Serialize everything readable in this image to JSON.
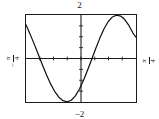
{
  "figure": {
    "kind": "function-graph",
    "frame_color": "#1b1b1b",
    "curve_color": "#111111",
    "background": "#ffffff"
  },
  "labels": {
    "top": "2",
    "bottom": "−2",
    "left": {
      "minus": "−",
      "numerator": "π",
      "denominator": "4"
    },
    "right": {
      "minus": "",
      "numerator": "π",
      "denominator": "4"
    }
  },
  "chart_data": {
    "type": "line",
    "title": "",
    "xlabel": "",
    "ylabel": "",
    "xlim": [
      -0.7853981634,
      0.7853981634
    ],
    "ylim": [
      -2,
      2
    ],
    "xlim_labels": [
      "−π/4",
      "π/4"
    ],
    "ylim_labels": [
      "−2",
      "2"
    ],
    "grid": false,
    "legend": "none",
    "axes": {
      "x_axis_at_y": 0,
      "y_axis_at_x": 0,
      "x_tick_spacing": 0.19634954,
      "y_tick_spacing": 0.5,
      "tick_style": "inner-ticks"
    },
    "series": [
      {
        "name": "y = 2 sin(4x)  (shape: descends from upper-left, minimum near x = −π/8, rises through origin, maximum near x = π/8 region, slight fall at right edge)",
        "x": [
          -0.785398,
          -0.726642,
          -0.667887,
          -0.609131,
          -0.550376,
          -0.49162,
          -0.432865,
          -0.374109,
          -0.315354,
          -0.256598,
          -0.197843,
          -0.139087,
          -0.080332,
          -0.021576,
          0.037179,
          0.095935,
          0.15469,
          0.213446,
          0.272201,
          0.330957,
          0.389712,
          0.448468,
          0.507223,
          0.565979,
          0.624734,
          0.68349,
          0.742245,
          0.785398
        ],
        "y": [
          1.55,
          1.12,
          0.66,
          0.18,
          -0.3,
          -0.76,
          -1.18,
          -1.52,
          -1.78,
          -1.94,
          -1.99,
          -1.92,
          -1.72,
          -1.4,
          -0.99,
          -0.52,
          -0.02,
          0.48,
          0.96,
          1.38,
          1.7,
          1.91,
          1.99,
          1.95,
          1.79,
          1.52,
          1.17,
          0.98
        ]
      }
    ],
    "markers": {
      "x_ticks_visible": true,
      "y_ticks_visible": true,
      "data_labels": false
    }
  }
}
